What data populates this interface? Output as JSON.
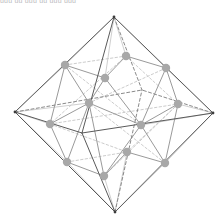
{
  "figure": {
    "title_strip": "uuu  uu   uuu   uu uuu  uuu",
    "canvas": {
      "width": 224,
      "height": 223
    },
    "background": "#ffffff",
    "colors": {
      "outer_edge_visible": "#5a5a5a",
      "outer_edge_hidden": "#8a8a8a",
      "inner_edge_visible": "#9a9a9a",
      "inner_edge_hidden": "#c6c6c6",
      "node_fill": "#a8a8a8",
      "apex_fill": "#3c3c3c"
    },
    "node_radius": 4.2,
    "apex_radius": 1.4,
    "outer_vertices": [
      {
        "name": "apex-top",
        "x": 114,
        "y": 17
      },
      {
        "name": "apex-bottom",
        "x": 115,
        "y": 212
      },
      {
        "name": "apex-left",
        "x": 15,
        "y": 112
      },
      {
        "name": "apex-right",
        "x": 213,
        "y": 113
      },
      {
        "name": "apex-front",
        "x": 82,
        "y": 133
      },
      {
        "name": "apex-back",
        "x": 142,
        "y": 90
      }
    ],
    "outer_edges_visible": [
      [
        "apex-top",
        "apex-left"
      ],
      [
        "apex-top",
        "apex-right"
      ],
      [
        "apex-bottom",
        "apex-left"
      ],
      [
        "apex-bottom",
        "apex-right"
      ],
      [
        "apex-top",
        "apex-front"
      ],
      [
        "apex-bottom",
        "apex-front"
      ],
      [
        "apex-left",
        "apex-front"
      ],
      [
        "apex-right",
        "apex-front"
      ]
    ],
    "outer_edges_hidden": [
      [
        "apex-top",
        "apex-back"
      ],
      [
        "apex-bottom",
        "apex-back"
      ],
      [
        "apex-left",
        "apex-back"
      ],
      [
        "apex-right",
        "apex-back"
      ]
    ],
    "inner_nodes": [
      {
        "name": "cubo-u1",
        "x": 65,
        "y": 65,
        "band": "upper"
      },
      {
        "name": "cubo-u2",
        "x": 105,
        "y": 78,
        "band": "upper"
      },
      {
        "name": "cubo-u3",
        "x": 126,
        "y": 56,
        "band": "upper"
      },
      {
        "name": "cubo-u4",
        "x": 166,
        "y": 68,
        "band": "upper"
      },
      {
        "name": "cubo-m1",
        "x": 50,
        "y": 124,
        "band": "middle"
      },
      {
        "name": "cubo-m2",
        "x": 89,
        "y": 103,
        "band": "middle"
      },
      {
        "name": "cubo-m3",
        "x": 141,
        "y": 125,
        "band": "middle"
      },
      {
        "name": "cubo-m4",
        "x": 178,
        "y": 104,
        "band": "middle"
      },
      {
        "name": "cubo-l1",
        "x": 67,
        "y": 162,
        "band": "lower"
      },
      {
        "name": "cubo-l2",
        "x": 104,
        "y": 176,
        "band": "lower"
      },
      {
        "name": "cubo-l3",
        "x": 127,
        "y": 152,
        "band": "lower"
      },
      {
        "name": "cubo-l4",
        "x": 165,
        "y": 163,
        "band": "lower"
      }
    ],
    "inner_edges_visible": [
      [
        "cubo-u1",
        "cubo-u2"
      ],
      [
        "cubo-u2",
        "cubo-u3"
      ],
      [
        "cubo-u3",
        "cubo-u4"
      ],
      [
        "cubo-u1",
        "cubo-m2"
      ],
      [
        "cubo-u2",
        "cubo-m2"
      ],
      [
        "cubo-u1",
        "cubo-m1"
      ],
      [
        "cubo-u4",
        "cubo-m4"
      ],
      [
        "cubo-u4",
        "cubo-m3"
      ],
      [
        "cubo-u2",
        "cubo-m3"
      ],
      [
        "cubo-m1",
        "cubo-m2"
      ],
      [
        "cubo-m2",
        "cubo-m3"
      ],
      [
        "cubo-m3",
        "cubo-m4"
      ],
      [
        "cubo-m1",
        "cubo-l1"
      ],
      [
        "cubo-m2",
        "cubo-l1"
      ],
      [
        "cubo-m2",
        "cubo-l2"
      ],
      [
        "cubo-m3",
        "cubo-l2"
      ],
      [
        "cubo-m3",
        "cubo-l4"
      ],
      [
        "cubo-m4",
        "cubo-l4"
      ],
      [
        "cubo-l1",
        "cubo-l2"
      ],
      [
        "cubo-l2",
        "cubo-l3"
      ],
      [
        "cubo-l3",
        "cubo-l4"
      ]
    ],
    "inner_edges_hidden": [
      [
        "cubo-u1",
        "cubo-u3"
      ],
      [
        "cubo-u3",
        "cubo-m4"
      ],
      [
        "cubo-u3",
        "cubo-m1"
      ],
      [
        "cubo-m1",
        "cubo-m4"
      ],
      [
        "cubo-m4",
        "cubo-l3"
      ],
      [
        "cubo-m1",
        "cubo-l3"
      ],
      [
        "cubo-l1",
        "cubo-l3"
      ],
      [
        "cubo-u1",
        "cubo-m3"
      ],
      [
        "cubo-u4",
        "cubo-m2"
      ],
      [
        "cubo-l2",
        "cubo-m4"
      ],
      [
        "cubo-l4",
        "cubo-m2"
      ]
    ],
    "connector_edges": [
      [
        "apex-top",
        "cubo-u1"
      ],
      [
        "apex-top",
        "cubo-u2"
      ],
      [
        "apex-top",
        "cubo-u3"
      ],
      [
        "apex-top",
        "cubo-u4"
      ],
      [
        "apex-bottom",
        "cubo-l1"
      ],
      [
        "apex-bottom",
        "cubo-l2"
      ],
      [
        "apex-bottom",
        "cubo-l3"
      ],
      [
        "apex-bottom",
        "cubo-l4"
      ],
      [
        "apex-left",
        "cubo-u1"
      ],
      [
        "apex-left",
        "cubo-m1"
      ],
      [
        "apex-left",
        "cubo-m2"
      ],
      [
        "apex-left",
        "cubo-l1"
      ],
      [
        "apex-right",
        "cubo-u4"
      ],
      [
        "apex-right",
        "cubo-m3"
      ],
      [
        "apex-right",
        "cubo-m4"
      ],
      [
        "apex-right",
        "cubo-l4"
      ]
    ]
  }
}
